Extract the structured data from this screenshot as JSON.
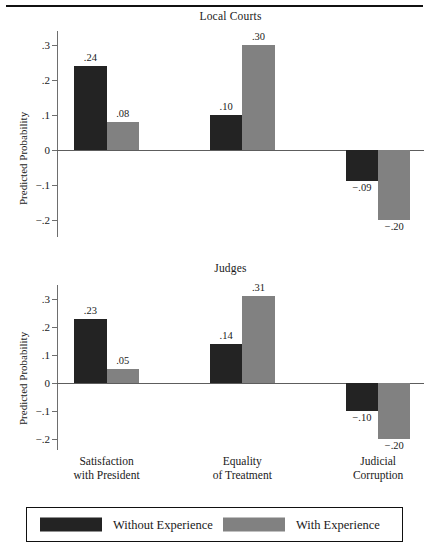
{
  "chart_data": {
    "type": "bar",
    "title": "",
    "panels": [
      {
        "title": "Local Courts",
        "ylabel": "Predicted Probability",
        "xlabel": "",
        "categories": [
          "Satisfaction with President",
          "Equality of Treatment",
          "Judicial Corruption"
        ],
        "series": [
          {
            "name": "Without Experience",
            "color": "#232323",
            "values": [
              0.24,
              0.1,
              -0.09
            ],
            "labels": [
              ".24",
              ".10",
              "−.09"
            ]
          },
          {
            "name": "With Experience",
            "color": "#818181",
            "values": [
              0.08,
              0.3,
              -0.2
            ],
            "labels": [
              ".08",
              ".30",
              "−.20"
            ]
          }
        ],
        "ylim": [
          -0.25,
          0.34
        ],
        "yticks": [
          0.3,
          0.2,
          0.1,
          0.0,
          -0.1,
          -0.2
        ],
        "ytick_labels": [
          ".3",
          ".2",
          ".1",
          "0",
          "−.1",
          "−.2"
        ],
        "grid": false
      },
      {
        "title": "Judges",
        "ylabel": "Predicted Probability",
        "xlabel": "",
        "categories": [
          "Satisfaction with President",
          "Equality of Treatment",
          "Judicial Corruption"
        ],
        "series": [
          {
            "name": "Without Experience",
            "color": "#232323",
            "values": [
              0.23,
              0.14,
              -0.1
            ],
            "labels": [
              ".23",
              ".14",
              "−.10"
            ]
          },
          {
            "name": "With Experience",
            "color": "#818181",
            "values": [
              0.05,
              0.31,
              -0.2
            ],
            "labels": [
              ".05",
              ".31",
              "−.20"
            ]
          }
        ],
        "ylim": [
          -0.24,
          0.35
        ],
        "yticks": [
          0.3,
          0.2,
          0.1,
          0.0,
          -0.1,
          -0.2
        ],
        "ytick_labels": [
          ".3",
          ".2",
          ".1",
          "0",
          "−.1",
          "−.2"
        ],
        "grid": false
      }
    ],
    "legend": {
      "position": "bottom",
      "entries": [
        {
          "label": "Without Experience",
          "color": "#232323"
        },
        {
          "label": "With Experience",
          "color": "#818181"
        }
      ]
    },
    "category_labels": [
      {
        "line1": "Satisfaction",
        "line2": "with President"
      },
      {
        "line1": "Equality",
        "line2": "of Treatment"
      },
      {
        "line1": "Judicial",
        "line2": "Corruption"
      }
    ]
  }
}
